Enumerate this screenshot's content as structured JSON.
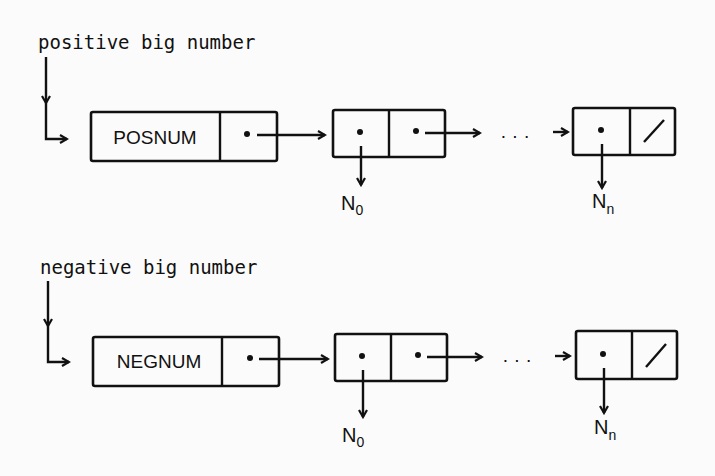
{
  "diagram": {
    "type": "linked-list-representation",
    "rows": [
      {
        "id": "positive",
        "label": "positive big number",
        "header_tag": "POSNUM",
        "first_node_value": "N",
        "first_node_subscript": "0",
        "last_node_value": "N",
        "last_node_subscript": "n",
        "ellipsis": "· · ·",
        "terminator": "/"
      },
      {
        "id": "negative",
        "label": "negative big number",
        "header_tag": "NEGNUM",
        "first_node_value": "N",
        "first_node_subscript": "0",
        "last_node_value": "N",
        "last_node_subscript": "n",
        "ellipsis": "· · ·",
        "terminator": "/"
      }
    ],
    "colors": {
      "ink": "#111111",
      "background": "#fbfbfb"
    }
  }
}
